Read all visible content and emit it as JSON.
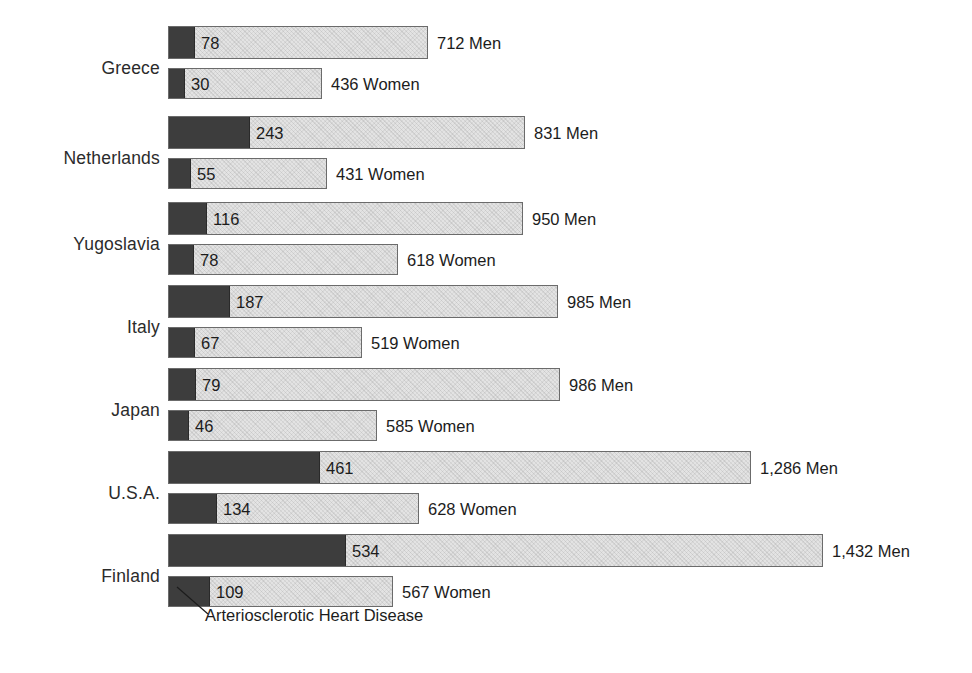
{
  "chart_data": {
    "type": "bar",
    "orientation": "horizontal",
    "title": "",
    "subtitle": "",
    "xlabel": "",
    "ylabel": "",
    "grid": false,
    "legend_position": "none",
    "annotation": "Arteriosclerotic Heart Disease",
    "segment_names": [
      "Arteriosclerotic Heart Disease",
      "All other causes"
    ],
    "segment_colors": [
      "#3d3d3d",
      "#e3e3e3"
    ],
    "categories": [
      "Greece",
      "Netherlands",
      "Yugoslavia",
      "Italy",
      "Japan",
      "U.S.A.",
      "Finland"
    ],
    "series": [
      {
        "name": "Men",
        "values": [
          712,
          831,
          950,
          985,
          986,
          1286,
          1432
        ]
      },
      {
        "name": "Women",
        "values": [
          436,
          431,
          618,
          519,
          585,
          628,
          567
        ]
      }
    ],
    "series_heart_disease": [
      {
        "name": "Men",
        "values": [
          78,
          243,
          116,
          187,
          79,
          461,
          534
        ]
      },
      {
        "name": "Women",
        "values": [
          30,
          55,
          78,
          67,
          46,
          134,
          109
        ]
      }
    ],
    "rows": [
      {
        "country": "Greece",
        "label_top": 58,
        "group_top": 26,
        "men": {
          "value": 78,
          "value_text": "78",
          "total": 712,
          "total_text": "712 Men",
          "bar_px": 260,
          "dark_px": 25,
          "top": 0
        },
        "women": {
          "value": 30,
          "value_text": "30",
          "total": 436,
          "total_text": "436 Women",
          "bar_px": 154,
          "dark_px": 15,
          "top": 42
        }
      },
      {
        "country": "Netherlands",
        "label_top": 148,
        "group_top": 116,
        "men": {
          "value": 243,
          "value_text": "243",
          "total": 831,
          "total_text": "831 Men",
          "bar_px": 357,
          "dark_px": 80,
          "top": 0
        },
        "women": {
          "value": 55,
          "value_text": "55",
          "total": 431,
          "total_text": "431 Women",
          "bar_px": 159,
          "dark_px": 21,
          "top": 42
        }
      },
      {
        "country": "Yugoslavia",
        "label_top": 234,
        "group_top": 202,
        "men": {
          "value": 116,
          "value_text": "116",
          "total": 950,
          "total_text": "950 Men",
          "bar_px": 355,
          "dark_px": 37,
          "top": 0
        },
        "women": {
          "value": 78,
          "value_text": "78",
          "total": 618,
          "total_text": "618 Women",
          "bar_px": 230,
          "dark_px": 24,
          "top": 42
        }
      },
      {
        "country": "Italy",
        "label_top": 317,
        "group_top": 285,
        "men": {
          "value": 187,
          "value_text": "187",
          "total": 985,
          "total_text": "985 Men",
          "bar_px": 390,
          "dark_px": 60,
          "top": 0
        },
        "women": {
          "value": 67,
          "value_text": "67",
          "total": 519,
          "total_text": "519 Women",
          "bar_px": 194,
          "dark_px": 25,
          "top": 42
        }
      },
      {
        "country": "Japan",
        "label_top": 400,
        "group_top": 368,
        "men": {
          "value": 79,
          "value_text": "79",
          "total": 986,
          "total_text": "986 Men",
          "bar_px": 392,
          "dark_px": 26,
          "top": 0
        },
        "women": {
          "value": 46,
          "value_text": "46",
          "total": 585,
          "total_text": "585 Women",
          "bar_px": 209,
          "dark_px": 19,
          "top": 42
        }
      },
      {
        "country": "U.S.A.",
        "label_top": 483,
        "group_top": 451,
        "men": {
          "value": 461,
          "value_text": "461",
          "total": 1286,
          "total_text": "1,286 Men",
          "bar_px": 583,
          "dark_px": 150,
          "top": 0
        },
        "women": {
          "value": 134,
          "value_text": "134",
          "total": 628,
          "total_text": "628 Women",
          "bar_px": 251,
          "dark_px": 47,
          "top": 42
        }
      },
      {
        "country": "Finland",
        "label_top": 566,
        "group_top": 534,
        "men": {
          "value": 534,
          "value_text": "534",
          "total": 1432,
          "total_text": "1,432 Men",
          "bar_px": 655,
          "dark_px": 176,
          "top": 0
        },
        "women": {
          "value": 109,
          "value_text": "109",
          "total": 567,
          "total_text": "567 Women",
          "bar_px": 225,
          "dark_px": 40,
          "top": 42
        }
      }
    ]
  }
}
